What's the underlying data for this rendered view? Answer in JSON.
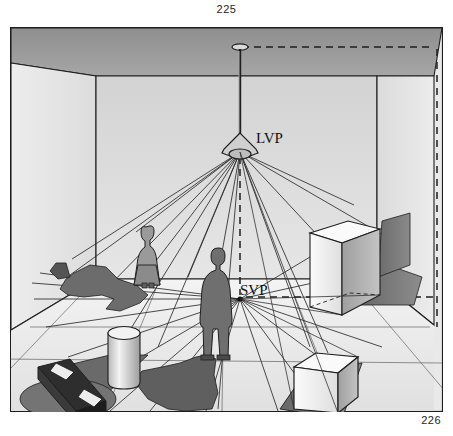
{
  "figure": {
    "top_number": "225",
    "bottom_number": "226"
  },
  "diagram": {
    "labels": {
      "light_vanishing_point": "LVP",
      "shadow_vanishing_point": "SVP"
    },
    "points": {
      "lvp": {
        "x": 240,
        "y": 143,
        "note": "Light Vanishing Point at lamp"
      },
      "svp": {
        "x": 240,
        "y": 297,
        "note": "Shadow Vanishing Point on floor"
      },
      "ceiling_mount": {
        "x": 240,
        "y": 47
      }
    },
    "objects": [
      {
        "name": "ceiling-lamp",
        "type": "lamp"
      },
      {
        "name": "woman-figure",
        "type": "person"
      },
      {
        "name": "man-figure",
        "type": "person"
      },
      {
        "name": "cylinder",
        "type": "solid"
      },
      {
        "name": "dark-beam",
        "type": "solid"
      },
      {
        "name": "tall-box",
        "type": "solid"
      },
      {
        "name": "cube",
        "type": "solid"
      }
    ],
    "colors": {
      "ceiling": "#9b9b9b",
      "back_wall": "#dcdcdc",
      "left_wall": "#e4e4e4",
      "right_wall": "#e2e2e2",
      "floor": "#e9e9e9",
      "floor_back": "#f2f2f2",
      "shadow": "#6d6d6d",
      "shadow_dark": "#595959",
      "outline": "#1e1e1e",
      "ray": "#2b2b2b",
      "page_background": "#ffffff",
      "box_light": "#f7f7f7",
      "box_mid": "#c9c9c9",
      "box_dark": "#8f8f8f"
    }
  }
}
